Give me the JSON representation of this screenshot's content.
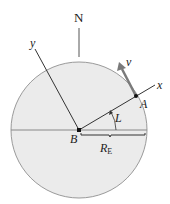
{
  "diagram": {
    "type": "earth-rotation-frame",
    "labels": {
      "north": "N",
      "y_axis": "y",
      "x_axis": "x",
      "velocity": "v",
      "point_A": "A",
      "point_B": "B",
      "latitude": "L",
      "radius": "R",
      "radius_sub": "E"
    },
    "colors": {
      "earth_fill": "#ebebeb",
      "earth_outline": "#9a9a9a",
      "line": "#333333",
      "velocity_arrow": "#7a7a7a",
      "point": "#111111"
    },
    "geometry": {
      "center": [
        79,
        130
      ],
      "radius": 68,
      "point_A": [
        136,
        96
      ],
      "latitude_deg": 31
    }
  }
}
